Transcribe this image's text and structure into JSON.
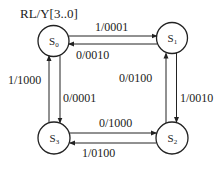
{
  "diagram": {
    "type": "state-machine",
    "header": "RL/Y[3..0]",
    "states": [
      {
        "id": "S0",
        "label": "S",
        "sub": "0"
      },
      {
        "id": "S1",
        "label": "S",
        "sub": "1"
      },
      {
        "id": "S2",
        "label": "S",
        "sub": "2"
      },
      {
        "id": "S3",
        "label": "S",
        "sub": "3"
      }
    ],
    "transitions": [
      {
        "from": "S0",
        "to": "S1",
        "label": "1/0001"
      },
      {
        "from": "S1",
        "to": "S0",
        "label": "0/0010"
      },
      {
        "from": "S1",
        "to": "S2",
        "label": "1/0010"
      },
      {
        "from": "S2",
        "to": "S1",
        "label": "0/0100"
      },
      {
        "from": "S3",
        "to": "S2",
        "label": "0/1000"
      },
      {
        "from": "S2",
        "to": "S3",
        "label": "1/0100"
      },
      {
        "from": "S0",
        "to": "S3",
        "label": "0/0001"
      },
      {
        "from": "S3",
        "to": "S0",
        "label": "1/1000"
      }
    ],
    "colors": {
      "stroke": "#222222",
      "background": "#ffffff"
    }
  }
}
